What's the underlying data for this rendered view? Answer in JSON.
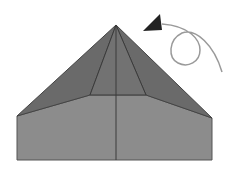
{
  "diagram": {
    "type": "origami-fold-step",
    "colors": {
      "background": "#ffffff",
      "top_flap": "#6e6e6e",
      "inner_flap": "#737373",
      "lower_body": "#8c8c8c",
      "crease": "#3a3a3a",
      "arrow": "#2a2a2a",
      "arrow_path": "#9a9a9a"
    },
    "symbols": [
      {
        "name": "turn-over-arrow",
        "meaning": "turn model over"
      }
    ]
  }
}
